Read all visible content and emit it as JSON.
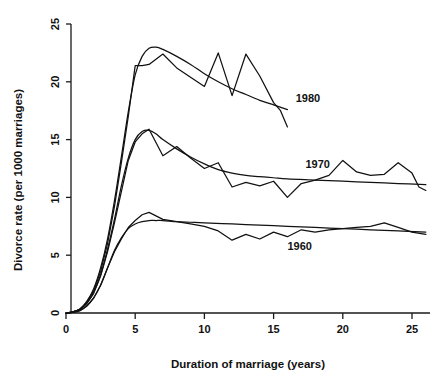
{
  "chart_data": {
    "type": "line",
    "title": "",
    "xlabel": "Duration of marriage (years)",
    "ylabel": "Divorce rate (per 1000 marriages)",
    "xlim": [
      0,
      26.5
    ],
    "ylim": [
      0,
      25.8
    ],
    "xticks": [
      0,
      5,
      10,
      15,
      20,
      25
    ],
    "yticks": [
      0,
      5,
      10,
      15,
      20,
      25
    ],
    "xtick_labels": [
      "0",
      "5",
      "10",
      "15",
      "20",
      "25"
    ],
    "ytick_labels": [
      "0",
      "5",
      "10",
      "15",
      "20",
      "25"
    ],
    "grid": false,
    "legend": "inline-annotations",
    "annotations": [
      {
        "text": "1980",
        "x": 16.6,
        "y": 18.6
      },
      {
        "text": "1970",
        "x": 17.3,
        "y": 12.9
      },
      {
        "text": "1960",
        "x": 16.0,
        "y": 5.8
      }
    ],
    "series": [
      {
        "name": "1980",
        "label": "1980",
        "type": "observed",
        "x": [
          0,
          0.5,
          1,
          1.5,
          2,
          2.5,
          3,
          3.5,
          4,
          4.5,
          5,
          5.5,
          6,
          7,
          8,
          9,
          10,
          11,
          12,
          13,
          14,
          15,
          15.5,
          16
        ],
        "y": [
          0,
          0.1,
          0.3,
          0.9,
          1.9,
          3.6,
          6.0,
          9.2,
          13.0,
          17.0,
          21.4,
          21.4,
          21.5,
          22.4,
          21.2,
          20.4,
          19.6,
          22.5,
          18.8,
          22.4,
          20.5,
          18.2,
          17.5,
          16.1
        ]
      },
      {
        "name": "1980",
        "label": "1980",
        "type": "fitted",
        "x": [
          0,
          0.5,
          1,
          1.5,
          2,
          2.5,
          3,
          3.5,
          4,
          4.5,
          5,
          5.5,
          6,
          6.5,
          7,
          8,
          9,
          10,
          11,
          12,
          13,
          14,
          15,
          16
        ],
        "y": [
          0,
          0.1,
          0.35,
          1.0,
          2.1,
          3.9,
          6.4,
          9.7,
          13.5,
          17.4,
          20.6,
          22.2,
          22.9,
          23.0,
          22.8,
          22.2,
          21.5,
          20.7,
          20.0,
          19.4,
          18.9,
          18.4,
          18.0,
          17.6
        ]
      },
      {
        "name": "1970",
        "label": "1970",
        "type": "observed",
        "x": [
          0,
          0.5,
          1,
          1.5,
          2,
          2.5,
          3,
          3.5,
          4,
          4.5,
          5,
          5.5,
          6,
          7,
          8,
          9,
          10,
          11,
          12,
          13,
          14,
          15,
          16,
          17,
          18,
          19,
          20,
          21,
          22,
          23,
          24,
          25,
          25.5,
          26
        ],
        "y": [
          0,
          0.1,
          0.3,
          0.8,
          1.7,
          3.2,
          5.3,
          7.8,
          10.5,
          13.2,
          14.8,
          15.5,
          15.9,
          13.6,
          14.4,
          13.4,
          12.5,
          13.0,
          10.9,
          11.3,
          11.0,
          11.4,
          10.0,
          11.2,
          11.5,
          11.9,
          13.2,
          12.2,
          11.9,
          12.0,
          13.0,
          12.1,
          10.9,
          10.6
        ]
      },
      {
        "name": "1970",
        "label": "1970",
        "type": "fitted",
        "x": [
          0,
          0.5,
          1,
          1.5,
          2,
          2.5,
          3,
          3.5,
          4,
          4.5,
          5,
          5.5,
          6,
          6.5,
          7,
          8,
          9,
          10,
          11,
          12,
          13,
          14,
          15,
          16,
          18,
          20,
          22,
          24,
          26
        ],
        "y": [
          0,
          0.1,
          0.32,
          0.85,
          1.8,
          3.3,
          5.5,
          8.1,
          11.0,
          13.4,
          15.0,
          15.7,
          15.8,
          15.5,
          15.0,
          14.2,
          13.5,
          12.9,
          12.4,
          12.1,
          11.9,
          11.8,
          11.7,
          11.6,
          11.5,
          11.4,
          11.3,
          11.2,
          11.1
        ]
      },
      {
        "name": "1960",
        "label": "1960",
        "type": "observed",
        "x": [
          0,
          0.5,
          1,
          1.5,
          2,
          2.5,
          3,
          3.5,
          4,
          4.5,
          5,
          5.5,
          6,
          6.5,
          7,
          8,
          9,
          10,
          11,
          12,
          13,
          14,
          15,
          16,
          17,
          18,
          19,
          20,
          21,
          22,
          23,
          24,
          25,
          26
        ],
        "y": [
          0,
          0.05,
          0.2,
          0.6,
          1.3,
          2.4,
          3.9,
          5.3,
          6.4,
          7.4,
          8.0,
          8.5,
          8.7,
          8.4,
          8.1,
          7.9,
          7.7,
          7.5,
          7.1,
          6.3,
          6.8,
          6.4,
          7.0,
          6.6,
          7.2,
          7.0,
          7.2,
          7.3,
          7.4,
          7.5,
          7.8,
          7.4,
          7.0,
          6.8
        ]
      },
      {
        "name": "1960",
        "label": "1960",
        "type": "fitted",
        "x": [
          0,
          0.5,
          1,
          1.5,
          2,
          2.5,
          3,
          3.5,
          4,
          4.5,
          5,
          5.5,
          6,
          6.5,
          7,
          8,
          9,
          10,
          12,
          14,
          16,
          18,
          20,
          22,
          24,
          26
        ],
        "y": [
          0,
          0.05,
          0.2,
          0.6,
          1.3,
          2.4,
          3.9,
          5.4,
          6.5,
          7.3,
          7.7,
          7.9,
          8.0,
          8.0,
          8.0,
          7.9,
          7.85,
          7.8,
          7.7,
          7.6,
          7.5,
          7.4,
          7.3,
          7.2,
          7.1,
          7.0
        ]
      }
    ]
  },
  "axes": {
    "x_title": "Duration of marriage (years)",
    "y_title": "Divorce rate (per 1000 marriages)"
  },
  "labels": {
    "s1980": "1980",
    "s1970": "1970",
    "s1960": "1960"
  }
}
